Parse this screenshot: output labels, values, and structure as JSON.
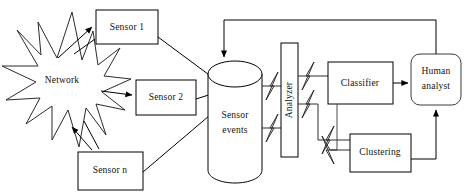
{
  "diagram": {
    "type": "flow-architecture",
    "background_color": "#ffffff",
    "line_color": "#000000",
    "text_color": "#111111",
    "nodes": {
      "network": {
        "label": "Network",
        "shape": "starburst"
      },
      "sensor1": {
        "label": "Sensor 1",
        "shape": "rectangle"
      },
      "sensor2": {
        "label": "Sensor 2",
        "shape": "rectangle"
      },
      "sensorn": {
        "label": "Sensor n",
        "shape": "rectangle"
      },
      "sensor_events": {
        "label_line1": "Sensor",
        "label_line2": "events",
        "shape": "cylinder"
      },
      "analyzer": {
        "label": "Analyzer",
        "shape": "rectangle-vertical-text"
      },
      "classifier": {
        "label": "Classifier",
        "shape": "rectangle"
      },
      "clustering": {
        "label": "Clustering",
        "shape": "rectangle"
      },
      "human_analyst": {
        "label_line1": "Human",
        "label_line2": "analyst",
        "shape": "rounded-rectangle"
      }
    }
  }
}
